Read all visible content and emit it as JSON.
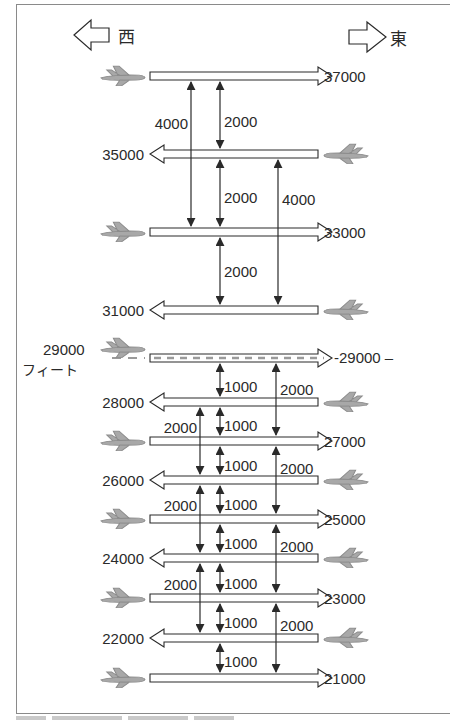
{
  "diagram": {
    "directions": {
      "west": {
        "label": "西",
        "icon": "left-arrow-icon"
      },
      "east": {
        "label": "東",
        "icon": "right-arrow-icon"
      }
    },
    "unit_label": "フィート",
    "colors": {
      "line": "#2a2a2a",
      "plane": "#a8a8a8",
      "plane_outline": "#8c8c8c",
      "dash": "#9a9a9a",
      "frame": "#8a8a8a"
    },
    "levels": [
      {
        "altitude": "37000",
        "direction": "east",
        "y": 76
      },
      {
        "altitude": "35000",
        "direction": "west",
        "y": 154
      },
      {
        "altitude": "33000",
        "direction": "east",
        "y": 232
      },
      {
        "altitude": "31000",
        "direction": "west",
        "y": 310
      },
      {
        "altitude": "29000",
        "direction": "east",
        "y": 358,
        "dashed": true,
        "left_label": "29000",
        "right_label": "-29000 –"
      },
      {
        "altitude": "28000",
        "direction": "west",
        "y": 402
      },
      {
        "altitude": "27000",
        "direction": "east",
        "y": 441
      },
      {
        "altitude": "26000",
        "direction": "west",
        "y": 480
      },
      {
        "altitude": "25000",
        "direction": "east",
        "y": 519
      },
      {
        "altitude": "24000",
        "direction": "west",
        "y": 558
      },
      {
        "altitude": "23000",
        "direction": "east",
        "y": 598
      },
      {
        "altitude": "22000",
        "direction": "west",
        "y": 638
      },
      {
        "altitude": "21000",
        "direction": "east",
        "y": 678
      }
    ],
    "separations": [
      {
        "x": 191,
        "from": "37000",
        "to": "33000",
        "label": "4000",
        "label_side": "left",
        "label_y": 124
      },
      {
        "x": 220,
        "from": "37000",
        "to": "35000",
        "label": "2000",
        "label_side": "right",
        "label_y": 122
      },
      {
        "x": 220,
        "from": "35000",
        "to": "33000",
        "label": "2000",
        "label_side": "right",
        "label_y": 198
      },
      {
        "x": 278,
        "from": "35000",
        "to": "31000",
        "label": "4000",
        "label_side": "right",
        "label_y": 200
      },
      {
        "x": 220,
        "from": "33000",
        "to": "31000",
        "label": "2000",
        "label_side": "right",
        "label_y": 272
      },
      {
        "x": 220,
        "from": "29000",
        "to": "28000",
        "label": "1000",
        "label_side": "right",
        "label_y": 387
      },
      {
        "x": 276,
        "from": "29000",
        "to": "27000",
        "label": "2000",
        "label_side": "right",
        "label_y": 390
      },
      {
        "x": 200,
        "from": "28000",
        "to": "26000",
        "label": "2000",
        "label_side": "left",
        "label_y": 428
      },
      {
        "x": 220,
        "from": "28000",
        "to": "27000",
        "label": "1000",
        "label_side": "right",
        "label_y": 426
      },
      {
        "x": 220,
        "from": "27000",
        "to": "26000",
        "label": "1000",
        "label_side": "right",
        "label_y": 466
      },
      {
        "x": 276,
        "from": "27000",
        "to": "25000",
        "label": "2000",
        "label_side": "right",
        "label_y": 469
      },
      {
        "x": 200,
        "from": "26000",
        "to": "24000",
        "label": "2000",
        "label_side": "left",
        "label_y": 506
      },
      {
        "x": 220,
        "from": "26000",
        "to": "25000",
        "label": "1000",
        "label_side": "right",
        "label_y": 505
      },
      {
        "x": 220,
        "from": "25000",
        "to": "24000",
        "label": "1000",
        "label_side": "right",
        "label_y": 544
      },
      {
        "x": 276,
        "from": "25000",
        "to": "23000",
        "label": "2000",
        "label_side": "right",
        "label_y": 547
      },
      {
        "x": 200,
        "from": "24000",
        "to": "22000",
        "label": "2000",
        "label_side": "left",
        "label_y": 585
      },
      {
        "x": 220,
        "from": "24000",
        "to": "23000",
        "label": "1000",
        "label_side": "right",
        "label_y": 584
      },
      {
        "x": 220,
        "from": "23000",
        "to": "22000",
        "label": "1000",
        "label_side": "right",
        "label_y": 623
      },
      {
        "x": 276,
        "from": "23000",
        "to": "21000",
        "label": "2000",
        "label_side": "right",
        "label_y": 626
      },
      {
        "x": 220,
        "from": "22000",
        "to": "21000",
        "label": "1000",
        "label_side": "right",
        "label_y": 662
      }
    ]
  }
}
